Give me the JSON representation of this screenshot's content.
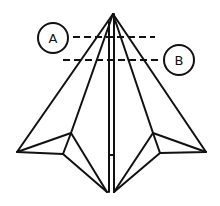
{
  "diagram": {
    "type": "origami-fold-diagram",
    "colors": {
      "line": "#111111",
      "background": "#ffffff"
    },
    "labels": [
      {
        "id": "A",
        "text": "A",
        "cx": 53,
        "cy": 38,
        "r": 15,
        "line": {
          "x1": 73,
          "x2": 155,
          "y": 37
        }
      },
      {
        "id": "B",
        "text": "B",
        "cx": 179,
        "cy": 60,
        "r": 15,
        "line": {
          "x1": 63,
          "x2": 162,
          "y": 60
        }
      }
    ]
  }
}
